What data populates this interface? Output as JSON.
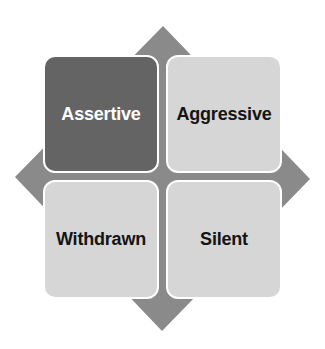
{
  "diagram": {
    "background_color": "#ffffff",
    "diamond_color": "#8a8a8a",
    "quadrants": [
      {
        "id": "top-left",
        "label": "Assertive",
        "fill": "#646464",
        "text_color": "#ffffff"
      },
      {
        "id": "top-right",
        "label": "Aggressive",
        "fill": "#d6d6d6",
        "text_color": "#141414"
      },
      {
        "id": "bottom-left",
        "label": "Withdrawn",
        "fill": "#d6d6d6",
        "text_color": "#141414"
      },
      {
        "id": "bottom-right",
        "label": "Silent",
        "fill": "#d6d6d6",
        "text_color": "#141414"
      }
    ]
  }
}
